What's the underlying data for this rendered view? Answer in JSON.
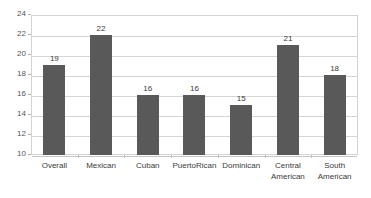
{
  "chart_data": {
    "type": "bar",
    "title": "",
    "subtitle": "",
    "xlabel": "",
    "ylabel": "",
    "categories": [
      "Overall",
      "Mexican",
      "Cuban",
      "PuertoRican",
      "Dominican",
      "Central\nAmerican",
      "South\nAmerican"
    ],
    "values": [
      19,
      22,
      16,
      16,
      15,
      21,
      18
    ],
    "value_labels": [
      "19",
      "22",
      "16",
      "16",
      "15",
      "21",
      "18"
    ],
    "ylim": [
      10,
      24
    ],
    "ytick_step": 2,
    "ytick_labels": [
      "10",
      "12",
      "14",
      "16",
      "18",
      "20",
      "22",
      "24"
    ],
    "ytick_values": [
      10,
      12,
      14,
      16,
      18,
      20,
      22,
      24
    ],
    "grid": true,
    "grid_axis": "y",
    "legend": false,
    "legend_position": "none",
    "annotations": []
  },
  "style": {
    "bar_color": "#595959",
    "grid_color": "#d6d6d6",
    "frame_color": "#d3d3d3",
    "axis_text_color": "#555555",
    "label_text_color": "#3a3a3a",
    "background": "#ffffff"
  }
}
